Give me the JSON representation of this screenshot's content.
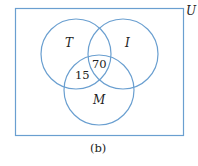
{
  "diagram": {
    "type": "venn",
    "universe_label": "U",
    "caption": "(b)",
    "line_color": "#6a9fd0",
    "sets": [
      {
        "id": "T",
        "label": "T"
      },
      {
        "id": "I",
        "label": "I"
      },
      {
        "id": "M",
        "label": "M"
      }
    ],
    "regions": [
      {
        "sets": [
          "T",
          "I",
          "M"
        ],
        "value": "70"
      },
      {
        "sets": [
          "T",
          "M"
        ],
        "only": true,
        "value": "15"
      }
    ]
  }
}
